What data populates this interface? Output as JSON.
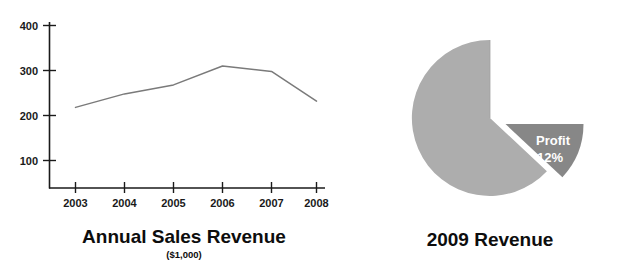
{
  "chart_data": [
    {
      "type": "line",
      "title": "Annual Sales Revenue",
      "subtitle": "($1,000)",
      "xlabel": "",
      "ylabel": "",
      "categories": [
        "2003",
        "2004",
        "2005",
        "2006",
        "2007",
        "2008"
      ],
      "values": [
        218,
        248,
        268,
        310,
        298,
        232
      ],
      "series": [
        {
          "name": "Annual Sales Revenue",
          "values": [
            218,
            248,
            268,
            310,
            298,
            232
          ]
        }
      ],
      "yticks": [
        100,
        200,
        300,
        400
      ],
      "ytick_labels": [
        "100",
        "200",
        "300",
        "400"
      ],
      "ylim": [
        0,
        430
      ],
      "grid": false,
      "legend": "none",
      "line_color": "#7a7a7a"
    },
    {
      "type": "pie",
      "title": "2009 Revenue",
      "labels": [
        "Profit",
        ""
      ],
      "slice_label_lines": [
        "Profit",
        "12%"
      ],
      "values": [
        12,
        88
      ],
      "percent_text": "12%",
      "exploded_slice": "Profit",
      "colors": [
        "#878787",
        "#adadad"
      ],
      "legend": "none"
    }
  ],
  "line_chart": {
    "title": "Annual Sales Revenue",
    "subtitle": "($1,000)",
    "x_tick_labels": [
      "2003",
      "2004",
      "2005",
      "2006",
      "2007",
      "2008"
    ],
    "y_tick_labels": [
      "400",
      "300",
      "200",
      "100"
    ]
  },
  "pie_chart": {
    "title": "2009 Revenue",
    "profit_label": "Profit",
    "profit_percent": "12%"
  },
  "colors": {
    "axis": "#1a1a1a",
    "line": "#7a7a7a",
    "pie_main": "#adadad",
    "pie_profit": "#878787",
    "text": "#0d0d0d",
    "slice_text": "#ffffff"
  }
}
